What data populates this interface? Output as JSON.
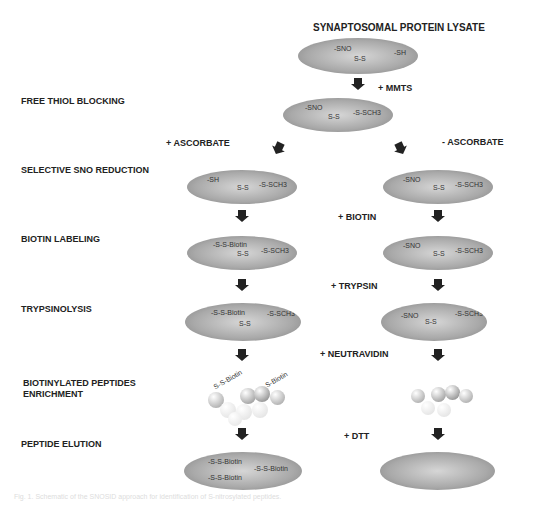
{
  "title": "SYNAPTOSOMAL PROTEIN LYSATE",
  "steps": [
    "FREE THIOL BLOCKING",
    "SELECTIVE  SNO REDUCTION",
    "BIOTIN LABELING",
    "TRYPSINOLYSIS",
    "BIOTINYLATED PEPTIDES\nENRICHMENT",
    "PEPTIDE ELUTION"
  ],
  "reagents": {
    "mmts": "+ MMTS",
    "plus_ascorbate": "+ ASCORBATE",
    "minus_ascorbate": "- ASCORBATE",
    "biotin": "+ BIOTIN",
    "trypsin": "+ TRYPSIN",
    "neutravidin": "+ NEUTRAVIDIN",
    "dtt": "+ DTT"
  },
  "ellipses": {
    "lysate": [
      "-SNO",
      "S-S",
      "-SH"
    ],
    "blocked": [
      "-SNO",
      "S-S",
      "-S-SCH3"
    ],
    "left_reduced": [
      "-SH",
      "S-S",
      "-S-SCH3"
    ],
    "right_reduced": [
      "-SNO",
      "S-S",
      "-S-SCH3"
    ],
    "left_biotin": [
      "-S-S-Biotin",
      "S-S",
      "-S-SCH3"
    ],
    "right_biotin": [
      "-SNO",
      "S-S",
      "-S-SCH3"
    ],
    "left_trypsin": [
      "-S-S-Biotin",
      "S-S",
      "-S-SCH3"
    ],
    "right_trypsin": [
      "-SNO",
      "S-S",
      "-S-SCH3"
    ],
    "left_enrich": [
      "S-S-Biotin",
      "S-Biotin"
    ],
    "left_elution": [
      "-S-S-Biotin",
      "-S-S-Biotin",
      "-S-S-Biotin"
    ]
  },
  "caption": "Fig. 1. Schematic of the SNOSID approach for identification of S-nitrosylated peptides."
}
